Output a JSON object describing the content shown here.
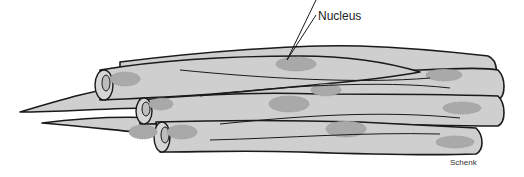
{
  "diagram": {
    "labels": {
      "nucleus": "Nucleus",
      "credit": "Schenk"
    },
    "colors": {
      "cell_fill": "#cfcfcf",
      "nucleus_fill": "#a9a9a9",
      "outline": "#1a1a1a",
      "background": "#ffffff"
    }
  }
}
